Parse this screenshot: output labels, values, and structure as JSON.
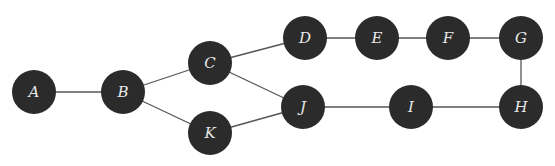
{
  "graph": {
    "node_color": "#2b2b2b",
    "label_color": "#e8e8e8",
    "edge_color": "#555555",
    "radius": 22,
    "nodes": [
      {
        "id": "A",
        "label": "A",
        "x": 34,
        "y": 92
      },
      {
        "id": "B",
        "label": "B",
        "x": 123,
        "y": 92
      },
      {
        "id": "C",
        "label": "C",
        "x": 210,
        "y": 63
      },
      {
        "id": "K",
        "label": "K",
        "x": 210,
        "y": 133
      },
      {
        "id": "D",
        "label": "D",
        "x": 305,
        "y": 38
      },
      {
        "id": "J",
        "label": "J",
        "x": 303,
        "y": 107
      },
      {
        "id": "E",
        "label": "E",
        "x": 377,
        "y": 38
      },
      {
        "id": "F",
        "label": "F",
        "x": 448,
        "y": 38
      },
      {
        "id": "G",
        "label": "G",
        "x": 521,
        "y": 38
      },
      {
        "id": "I",
        "label": "I",
        "x": 411,
        "y": 107
      },
      {
        "id": "H",
        "label": "H",
        "x": 521,
        "y": 107
      }
    ],
    "edges": [
      [
        "A",
        "B"
      ],
      [
        "B",
        "C"
      ],
      [
        "B",
        "K"
      ],
      [
        "C",
        "D"
      ],
      [
        "C",
        "J"
      ],
      [
        "K",
        "J"
      ],
      [
        "D",
        "E"
      ],
      [
        "E",
        "F"
      ],
      [
        "F",
        "G"
      ],
      [
        "G",
        "H"
      ],
      [
        "H",
        "I"
      ],
      [
        "I",
        "J"
      ]
    ]
  }
}
